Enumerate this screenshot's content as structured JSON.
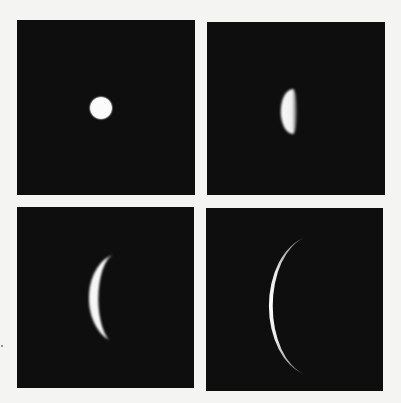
{
  "figure": {
    "layout": "2x2 grid",
    "background_color": "#f4f4f2",
    "panel_color": "#0e0e0e",
    "body_color": "#fafafa",
    "panels": [
      {
        "position": "top-left",
        "phase": "full (small gibbous disk)"
      },
      {
        "position": "top-right",
        "phase": "half (quarter)"
      },
      {
        "position": "bottom-left",
        "phase": "crescent"
      },
      {
        "position": "bottom-right",
        "phase": "thin crescent"
      }
    ]
  }
}
